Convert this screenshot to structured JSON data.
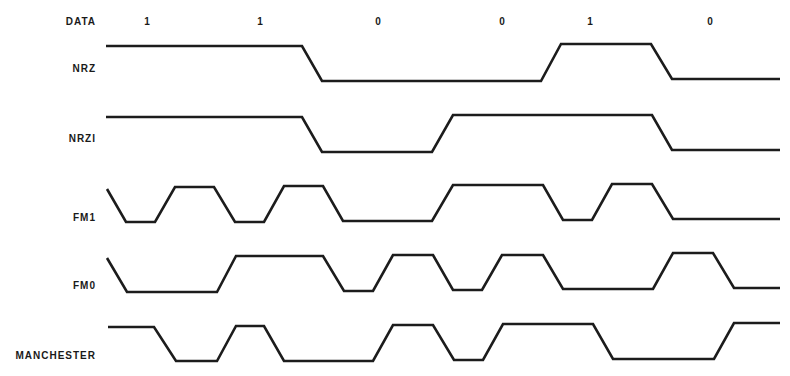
{
  "diagram": {
    "data_row": {
      "label": "DATA",
      "bits": [
        {
          "value": "1",
          "x": 147
        },
        {
          "value": "1",
          "x": 260
        },
        {
          "value": "0",
          "x": 378
        },
        {
          "value": "0",
          "x": 502
        },
        {
          "value": "1",
          "x": 590
        },
        {
          "value": "0",
          "x": 710
        }
      ]
    },
    "signals": [
      {
        "label": "NRZ",
        "label_y": 63,
        "points": "106,46 302,46 322,81 541,81 561,44 651,44 672,79 780,79"
      },
      {
        "label": "NRZI",
        "label_y": 133,
        "points": "106,117 302,117 322,152 432,152 453,115 652,115 672,150 780,150"
      },
      {
        "label": "FM1",
        "label_y": 212,
        "points": "107,189 126,222 155,222 175,187 214,187 235,222 264,222 284,186 323,186 343,221 432,221 453,185 543,185 563,220 592,220 612,184 652,184 673,219 780,219"
      },
      {
        "label": "FM0",
        "label_y": 280,
        "points": "107,258 127,292 217,292 236,256 323,256 344,291 373,291 393,255 433,255 453,290 482,290 502,255 543,255 563,289 653,289 673,253 713,253 734,288 780,288"
      },
      {
        "label": "MANCHESTER",
        "label_y": 350,
        "points": "108,327 154,327 176,361 217,361 236,326 264,326 284,361 373,361 393,325 433,325 454,360 483,360 503,324 593,324 613,359 714,359 734,323 780,323"
      }
    ],
    "stroke_color": "#1c1c1c",
    "background": "#ffffff"
  }
}
